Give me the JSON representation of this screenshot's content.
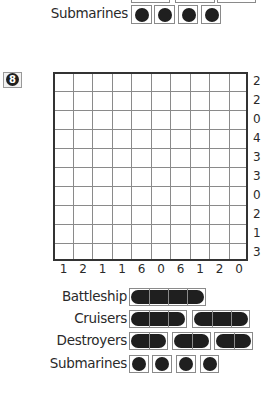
{
  "puzzle": {
    "number": "8",
    "row_clues": [
      "2",
      "2",
      "0",
      "4",
      "3",
      "3",
      "0",
      "2",
      "1",
      "3"
    ],
    "col_clues": [
      "1",
      "2",
      "1",
      "1",
      "6",
      "0",
      "6",
      "1",
      "2",
      "0"
    ]
  },
  "previous_puzzle_fleet": {
    "submarines_label": "Submarines"
  },
  "fleet": {
    "battleship_label": "Battleship",
    "cruisers_label": "Cruisers",
    "destroyers_label": "Destroyers",
    "submarines_label": "Submarines"
  }
}
